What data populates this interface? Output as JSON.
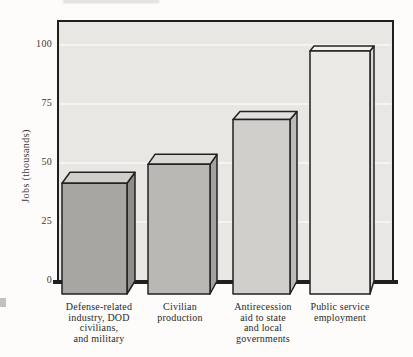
{
  "figure": {
    "y_axis_title": "Jobs (thousands)"
  },
  "chart_data": {
    "type": "bar",
    "style": "pseudo-3d grayscale columns, scanned textbook figure",
    "title": "",
    "xlabel": "",
    "ylabel": "Jobs (thousands)",
    "categories": [
      "Defense-related\nindustry, DOD\ncivilians,\nand military",
      "Civilian\nproduction",
      "Antirecession\naid to state\nand local\ngovernments",
      "Public service\nemployment"
    ],
    "values": [
      41,
      49,
      68,
      97
    ],
    "yticks": [
      0,
      25,
      50,
      75,
      100
    ],
    "ytick_labels": [
      "0",
      "25",
      "50",
      "75",
      "100"
    ],
    "ylim": [
      0,
      110
    ],
    "grid": "faint white horizontal lines at 25-unit intervals",
    "legend": "none",
    "colors": {
      "wall_background": "#e8e7e4",
      "outline": "#222222",
      "bar_fronts": [
        "#a7a6a3",
        "#b9b8b5",
        "#d0cfcc",
        "#eceae7"
      ],
      "bar_tops": [
        "#cfcecb",
        "#dad9d6",
        "#e2e1de",
        "#f2f1ee"
      ],
      "bar_sides": [
        "#8e8d8a",
        "#a3a29f",
        "#bbbab7",
        "#dad9d6"
      ]
    }
  }
}
